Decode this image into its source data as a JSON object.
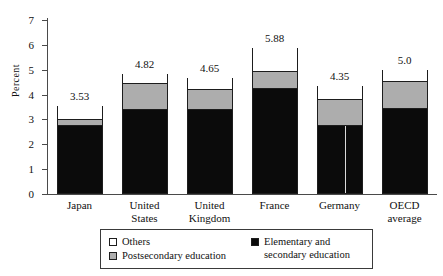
{
  "chart_data": {
    "type": "bar",
    "subtype": "stacked-bar",
    "title": "",
    "xlabel": "",
    "ylabel": "Percent",
    "ylim": [
      0,
      7
    ],
    "yticks": [
      "0",
      "1",
      "2",
      "3",
      "4",
      "5",
      "6",
      "7"
    ],
    "grid": false,
    "legend_position": "bottom",
    "categories": [
      "Japan",
      "United States",
      "United Kingdom",
      "France",
      "Germany",
      "OECD average"
    ],
    "category_lines": [
      [
        "Japan",
        ""
      ],
      [
        "United",
        "States"
      ],
      [
        "United",
        "Kingdom"
      ],
      [
        "France",
        ""
      ],
      [
        "Germany",
        ""
      ],
      [
        "OECD",
        "average"
      ]
    ],
    "totals": [
      3.53,
      4.82,
      4.65,
      5.88,
      4.35,
      5.0
    ],
    "total_labels": [
      "3.53",
      "4.82",
      "4.65",
      "5.88",
      "4.35",
      "5.0"
    ],
    "series": [
      {
        "name": "Elementary and secondary education",
        "color": "#0b0b0b",
        "values": [
          2.7,
          3.35,
          3.35,
          4.17,
          2.7,
          3.39
        ]
      },
      {
        "name": "Postsecondary education",
        "color": "#adadad",
        "values": [
          0.26,
          1.09,
          0.83,
          0.74,
          1.09,
          1.13
        ]
      },
      {
        "name": "Others",
        "color": "#ffffff",
        "values": [
          0.57,
          0.38,
          0.47,
          0.97,
          0.56,
          0.48
        ]
      }
    ]
  },
  "legend": {
    "items": [
      {
        "label": "Others",
        "label_line2": "",
        "swatch": "white"
      },
      {
        "label": "Postsecondary education",
        "label_line2": "",
        "swatch": "gray"
      },
      {
        "label": "Elementary and",
        "label_line2": "secondary education",
        "swatch": "black"
      }
    ]
  },
  "colors": {
    "black_segment": "#0b0b0b",
    "gray_segment": "#adadad",
    "white_segment": "#ffffff",
    "axis": "#4a4a4a",
    "outline": "#1d1d1d",
    "background": "#ffffff"
  }
}
